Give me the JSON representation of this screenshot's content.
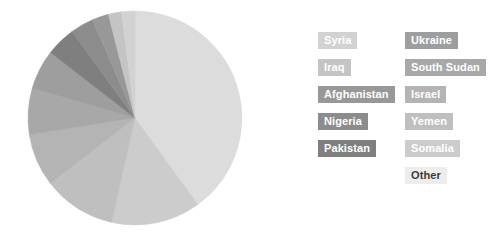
{
  "chart_data": {
    "type": "pie",
    "title": "",
    "legend_position": "right",
    "grid": false,
    "categories": [
      "Other",
      "Somalia",
      "Yemen",
      "Israel",
      "South Sudan",
      "Ukraine",
      "Pakistan",
      "Nigeria",
      "Afghanistan",
      "Iraq",
      "Syria"
    ],
    "values": [
      40.0,
      13.5,
      11.0,
      8.0,
      7.0,
      6.0,
      4.5,
      3.5,
      2.5,
      2.0,
      2.0
    ],
    "colors": [
      "#dcdcdc",
      "#cccccc",
      "#bfbfbf",
      "#b4b4b4",
      "#a8a8a8",
      "#9e9e9e",
      "#7f7f7f",
      "#8c8c8c",
      "#989898",
      "#c4c4c4",
      "#d2d2d2"
    ],
    "slices": [
      {
        "label": "Other",
        "value": 40.0,
        "color": "#dcdcdc"
      },
      {
        "label": "Somalia",
        "value": 13.5,
        "color": "#cccccc"
      },
      {
        "label": "Yemen",
        "value": 11.0,
        "color": "#bfbfbf"
      },
      {
        "label": "Israel",
        "value": 8.0,
        "color": "#b4b4b4"
      },
      {
        "label": "South Sudan",
        "value": 7.0,
        "color": "#a8a8a8"
      },
      {
        "label": "Ukraine",
        "value": 6.0,
        "color": "#9e9e9e"
      },
      {
        "label": "Pakistan",
        "value": 4.5,
        "color": "#7f7f7f"
      },
      {
        "label": "Nigeria",
        "value": 3.5,
        "color": "#8c8c8c"
      },
      {
        "label": "Afghanistan",
        "value": 2.5,
        "color": "#989898"
      },
      {
        "label": "Iraq",
        "value": 2.0,
        "color": "#c4c4c4"
      },
      {
        "label": "Syria",
        "value": 2.0,
        "color": "#d2d2d2"
      }
    ],
    "geometry": {
      "cx": 135,
      "cy": 118,
      "r": 107,
      "start_angle_deg": -90,
      "direction": "clockwise"
    }
  },
  "legend": {
    "left_column": [
      {
        "label": "Syria",
        "color": "#d2d2d2",
        "text_color": "#ffffff"
      },
      {
        "label": "Iraq",
        "color": "#c4c4c4",
        "text_color": "#ffffff"
      },
      {
        "label": "Afghanistan",
        "color": "#989898",
        "text_color": "#ffffff"
      },
      {
        "label": "Nigeria",
        "color": "#8c8c8c",
        "text_color": "#ffffff"
      },
      {
        "label": "Pakistan",
        "color": "#7f7f7f",
        "text_color": "#ffffff"
      }
    ],
    "right_column": [
      {
        "label": "Ukraine",
        "color": "#9e9e9e",
        "text_color": "#ffffff"
      },
      {
        "label": "South Sudan",
        "color": "#a8a8a8",
        "text_color": "#ffffff"
      },
      {
        "label": "Israel",
        "color": "#b4b4b4",
        "text_color": "#ffffff"
      },
      {
        "label": "Yemen",
        "color": "#bfbfbf",
        "text_color": "#ffffff"
      },
      {
        "label": "Somalia",
        "color": "#cccccc",
        "text_color": "#ffffff"
      },
      {
        "label": "Other",
        "color": "#ededed",
        "text_color": "#3a3a3a"
      }
    ]
  }
}
